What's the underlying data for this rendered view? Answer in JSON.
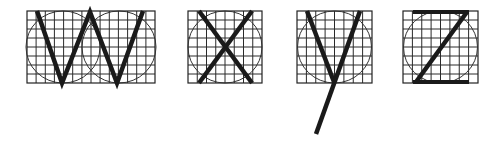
{
  "figure": {
    "letters": [
      {
        "char": "W",
        "box": {
          "x": 27,
          "y": 11,
          "w": 128,
          "h": 72
        },
        "cols": 14,
        "rows": 8
      },
      {
        "char": "X",
        "box": {
          "x": 188,
          "y": 11,
          "w": 74,
          "h": 72
        },
        "cols": 8,
        "rows": 8
      },
      {
        "char": "Y",
        "box": {
          "x": 297,
          "y": 11,
          "w": 75,
          "h": 72
        },
        "cols": 8,
        "rows": 8
      },
      {
        "char": "Z",
        "box": {
          "x": 403,
          "y": 11,
          "w": 75,
          "h": 72
        },
        "cols": 8,
        "rows": 8
      }
    ],
    "colors": {
      "ink": "#1a1a1a",
      "grid": "#2a2a2a",
      "background": "#ffffff"
    }
  }
}
